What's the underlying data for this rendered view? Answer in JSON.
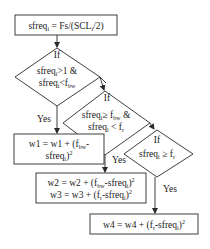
{
  "diagram": {
    "type": "flowchart",
    "start_box": {
      "text": "sfreq",
      "sub": "i",
      "text2": " = Fs/(SCL",
      "sub2": "i",
      "text3": "/2)"
    },
    "decision1": {
      "label": "If",
      "line1_a": "sfreq",
      "line1_sub": "i",
      "line1_b": ">1 &",
      "line2_a": "sfreq",
      "line2_sub": "i",
      "line2_b": "<f",
      "line2_sub2": "bw",
      "yes_label": "Yes"
    },
    "decision2": {
      "label": "If",
      "line1_a": "sfreq",
      "line1_sub": "i",
      "line1_b": "≥ f",
      "line1_sub2": "bw",
      "line1_c": " &",
      "line2_a": "sfreq",
      "line2_sub": "i",
      "line2_b": " < f",
      "line2_sub2": "r",
      "yes_label": "Yes"
    },
    "decision3": {
      "label": "If",
      "line1_a": "sfreq",
      "line1_sub": "i",
      "line1_b": " ≥ f",
      "line1_sub2": "r",
      "yes_label": "Yes"
    },
    "box_w1": {
      "line1_a": "w1 = w1 + (f",
      "line1_sub": "bw",
      "line1_b": "-",
      "line2_a": "sfreq",
      "line2_sub": "i",
      "line2_b": ")",
      "line2_sup": "2"
    },
    "box_w2w3": {
      "line1_a": "w2 = w2 + (f",
      "line1_sub": "bw",
      "line1_b": "-sfreq",
      "line1_sub2": "i",
      "line1_c": ")",
      "line1_sup": "2",
      "line2_a": "w3 = w3 + (f",
      "line2_sub": "r",
      "line2_b": "-sfreq",
      "line2_sub2": "i",
      "line2_c": ")",
      "line2_sup": "2"
    },
    "box_w4": {
      "line1_a": "w4 = w4 + (f",
      "line1_sub": "r",
      "line1_b": "-sfreq",
      "line1_sub2": "i",
      "line1_c": ")",
      "line1_sup": "2"
    },
    "colors": {
      "stroke": "#2a2a2a",
      "text": "#1a1a1a",
      "background": "#ffffff"
    }
  }
}
